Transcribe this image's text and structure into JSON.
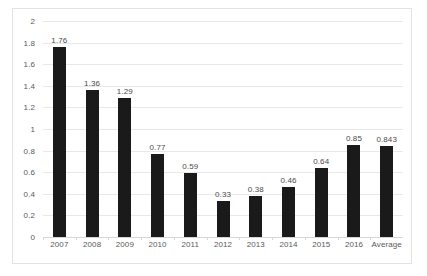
{
  "chart_data": {
    "type": "bar",
    "title": "",
    "subtitle": "",
    "xlabel": "",
    "ylabel": "",
    "ylim": [
      0,
      2
    ],
    "ytick_step": 0.2,
    "grid": true,
    "legend": false,
    "bar_color": "#1a1a1a",
    "gridline_color": "#e8e8e8",
    "label_color": "#4a4a4a",
    "axis_text_color": "#595959",
    "categories": [
      "2007",
      "2008",
      "2009",
      "2010",
      "2011",
      "2012",
      "2013",
      "2014",
      "2015",
      "2016",
      "Average"
    ],
    "values": [
      1.76,
      1.36,
      1.29,
      0.77,
      0.59,
      0.33,
      0.38,
      0.46,
      0.64,
      0.85,
      0.843
    ],
    "data_labels": [
      "1.76",
      "1.36",
      "1.29",
      "0.77",
      "0.59",
      "0.33",
      "0.38",
      "0.46",
      "0.64",
      "0.85",
      "0.843"
    ],
    "yticks": [
      "2",
      "1.8",
      "1.6",
      "1.4",
      "1.2",
      "1",
      "0.8",
      "0.6",
      "0.4",
      "0.2",
      "0"
    ],
    "ytick_values": [
      2,
      1.8,
      1.6,
      1.4,
      1.2,
      1,
      0.8,
      0.6,
      0.4,
      0.2,
      0
    ]
  }
}
